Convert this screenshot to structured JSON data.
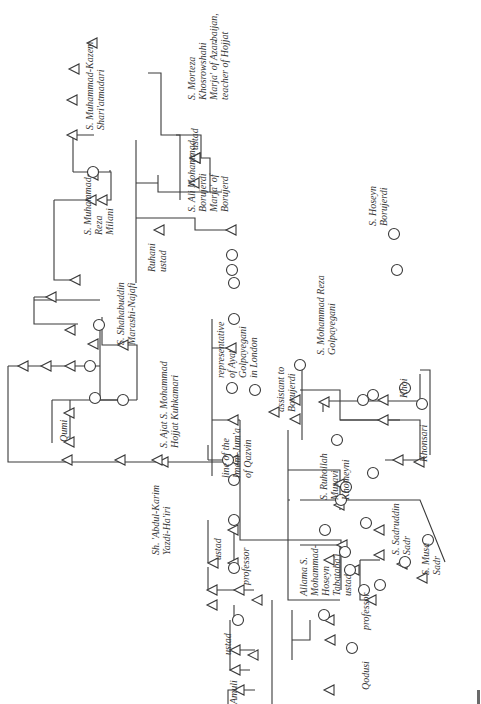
{
  "diagram": {
    "type": "kinship-chart",
    "orientation": "rotated-90-ccw",
    "colors": {
      "line": "#3a3a3a",
      "background": "#ffffff",
      "text": "#3a3a3a"
    },
    "legend_symbols": {
      "triangle": "male",
      "circle": "female"
    },
    "labels": [
      {
        "id": "shariatmadari",
        "text": "S. Muhammad-Kazem\nShari'atmadari",
        "x": 84,
        "y": 130
      },
      {
        "id": "khosrowshahi",
        "text": "S. Morteza\nKhosrowshahi\nMarja' of Azarbaijan,\nteacher of Hojjat",
        "x": 186,
        "y": 100
      },
      {
        "id": "ustad-borujerdi-top",
        "text": "ustad",
        "x": 189,
        "y": 150
      },
      {
        "id": "borujerdi-ali",
        "text": "S. Ali Mohammad\nBorujerdi\nMarja' of\nBorujerd",
        "x": 186,
        "y": 212
      },
      {
        "id": "milani",
        "text": "S. Muhammad-\nReza\nMilani",
        "x": 82,
        "y": 235
      },
      {
        "id": "ruhani",
        "text": "Ruhani\nustad",
        "x": 146,
        "y": 272
      },
      {
        "id": "marashi",
        "text": "S. Shahabuddin\nMarashi-Najafi",
        "x": 115,
        "y": 345
      },
      {
        "id": "hojjat",
        "text": "S. Ajat S. Mohammad\nHojjat Kuhkamari",
        "x": 158,
        "y": 448
      },
      {
        "id": "qumi",
        "text": "Qumi",
        "x": 58,
        "y": 442
      },
      {
        "id": "golpayegani-rep",
        "text": "representative\nof Ayat\nGolpayegani\nin London",
        "x": 215,
        "y": 378
      },
      {
        "id": "imam-jum",
        "text": "line of the\nImam-Jum'a\nof Qazvin",
        "x": 220,
        "y": 478
      },
      {
        "id": "hairi",
        "text": "Sh. 'Abdul-Karim\nYazdi-Ha'iri",
        "x": 150,
        "y": 555
      },
      {
        "id": "ustad-hairi",
        "text": "ustad",
        "x": 212,
        "y": 560
      },
      {
        "id": "professor-hairi",
        "text": "professor",
        "x": 240,
        "y": 585
      },
      {
        "id": "ustad-amuli",
        "text": "ustad",
        "x": 222,
        "y": 655
      },
      {
        "id": "amuli",
        "text": "Amuli",
        "x": 228,
        "y": 704
      },
      {
        "id": "golpayegani",
        "text": "S. Mohammad Reza\nGolpayegani",
        "x": 315,
        "y": 355
      },
      {
        "id": "assistant",
        "text": "assistant to\nBorujerdi",
        "x": 275,
        "y": 412
      },
      {
        "id": "khoi",
        "text": "Khoi",
        "x": 398,
        "y": 398
      },
      {
        "id": "khonsari",
        "text": "Khonsari",
        "x": 418,
        "y": 462
      },
      {
        "id": "khomeyni",
        "text": "S. Ruhollah\nMusavi\nKhomeyni",
        "x": 318,
        "y": 500
      },
      {
        "id": "sadruddin",
        "text": "S. Sadruddin\nSadr",
        "x": 390,
        "y": 555
      },
      {
        "id": "musa-sadr",
        "text": "S. Musa\nSadr",
        "x": 420,
        "y": 575
      },
      {
        "id": "tabatabai",
        "text": "Allama S.\nMohammad-\nHoseyn\nTabataba'i\nustad",
        "x": 298,
        "y": 596
      },
      {
        "id": "professor-tabatabai",
        "text": "professor",
        "x": 360,
        "y": 630
      },
      {
        "id": "qodusi",
        "text": "Qodusi",
        "x": 360,
        "y": 690
      },
      {
        "id": "hoseyn-borujerdi",
        "text": "S. Hoseyn\nBorujerdi",
        "x": 367,
        "y": 226
      }
    ],
    "lines": [
      "M216 40 L216 43 M148 73 L161 73 L161 135 L180 135 L180 200 M73 135 L73 172 M110 172 L110 170",
      "M73 135 L94 135 M73 172 L111 172 L111 200 L102 200",
      "M54 200 L54 280 L75 280 M54 200 L94 200",
      "M136 140 L136 283 M136 183 L158 183 M136 218 L195 218 L195 230 L230 230 M158 175 L158 192 L222 192",
      "M176 135 L201 135 L201 158 L210 158 L210 192",
      "M34 297 L34 324 L78 324 M34 297 L52 297 M34 300 L100 300",
      "M100 325 L100 400 L123 400 M102 317 L102 345 L137 345 L137 400",
      "M8 366 L8 462 L234 462 M8 366 L100 366",
      "M52 400 L52 443 M52 400 L137 400 M70 400 L70 443",
      "M212 319 L212 476 M212 348 L234 348 M212 400 L212 420",
      "M208 445 L208 460 M208 460 L234 460",
      "M208 520 L208 563 M234 530 L234 563",
      "M208 567 L208 590 M208 590 L254 590 M234 605 L234 620",
      "M230 620 L230 650 L255 650 M230 650 L230 670 L250 670",
      "M228 705 L228 690 L255 690",
      "M240 420 L240 540 L341 540 L341 590 M212 420 L240 420",
      "M302 365 L302 440 M300 390 L340 390 L340 420 L400 420",
      "M323 401 L420 401 L420 374 M323 401 L323 412",
      "M340 420 L420 420 L420 460 L385 460",
      "M420 370 L430 370 L430 455",
      "M288 430 L288 600 L340 600 M288 470 L340 470 L340 510",
      "M288 500 L290 500 M300 500 L420 500 L445 562",
      "M300 545 L340 545 L340 578",
      "M360 560 L360 600 L372 600",
      "M360 560 L380 560",
      "M292 610 L292 660 M292 640 L310 640 L310 620",
      "M272 600 L272 730"
    ],
    "triangles": [
      [
        93,
        43
      ],
      [
        75,
        69
      ],
      [
        73,
        100
      ],
      [
        73,
        135
      ],
      [
        94,
        175
      ],
      [
        103,
        200
      ],
      [
        92,
        200
      ],
      [
        76,
        280
      ],
      [
        52,
        297
      ],
      [
        71,
        330
      ],
      [
        94,
        344
      ],
      [
        124,
        345
      ],
      [
        24,
        366
      ],
      [
        47,
        366
      ],
      [
        71,
        366
      ],
      [
        70,
        413
      ],
      [
        70,
        442
      ],
      [
        68,
        460
      ],
      [
        121,
        460
      ],
      [
        164,
        462
      ],
      [
        158,
        460
      ],
      [
        196,
        158
      ],
      [
        195,
        183
      ],
      [
        160,
        230
      ],
      [
        232,
        230
      ],
      [
        232,
        348
      ],
      [
        234,
        420
      ],
      [
        234,
        460
      ],
      [
        234,
        530
      ],
      [
        234,
        563
      ],
      [
        240,
        590
      ],
      [
        254,
        655
      ],
      [
        213,
        590
      ],
      [
        214,
        563
      ],
      [
        213,
        605
      ],
      [
        236,
        650
      ],
      [
        236,
        670
      ],
      [
        240,
        690
      ],
      [
        196,
        158
      ],
      [
        275,
        412
      ],
      [
        325,
        402
      ],
      [
        384,
        400
      ],
      [
        384,
        420
      ],
      [
        340,
        484
      ],
      [
        340,
        505
      ],
      [
        343,
        545
      ],
      [
        330,
        560
      ],
      [
        355,
        570
      ],
      [
        399,
        460
      ],
      [
        420,
        462
      ],
      [
        403,
        564
      ],
      [
        423,
        578
      ],
      [
        330,
        620
      ],
      [
        331,
        640
      ],
      [
        330,
        690
      ],
      [
        372,
        600
      ],
      [
        380,
        555
      ],
      [
        380,
        530
      ],
      [
        258,
        600
      ],
      [
        296,
        400
      ],
      [
        296,
        419
      ]
    ],
    "circles": [
      [
        93,
        172
      ],
      [
        99,
        325
      ],
      [
        90,
        366
      ],
      [
        95,
        398
      ],
      [
        123,
        400
      ],
      [
        234,
        319
      ],
      [
        234,
        283
      ],
      [
        232,
        255
      ],
      [
        232,
        270
      ],
      [
        232,
        388
      ],
      [
        228,
        460
      ],
      [
        234,
        480
      ],
      [
        234,
        520
      ],
      [
        234,
        568
      ],
      [
        238,
        620
      ],
      [
        300,
        365
      ],
      [
        255,
        390
      ],
      [
        373,
        395
      ],
      [
        405,
        388
      ],
      [
        422,
        404
      ],
      [
        363,
        400
      ],
      [
        373,
        473
      ],
      [
        346,
        487
      ],
      [
        341,
        500
      ],
      [
        345,
        552
      ],
      [
        350,
        570
      ],
      [
        325,
        530
      ],
      [
        324,
        615
      ],
      [
        366,
        523
      ],
      [
        380,
        585
      ],
      [
        364,
        590
      ],
      [
        405,
        562
      ],
      [
        428,
        540
      ],
      [
        352,
        648
      ],
      [
        337,
        440
      ],
      [
        394,
        234
      ],
      [
        397,
        270
      ]
    ]
  }
}
